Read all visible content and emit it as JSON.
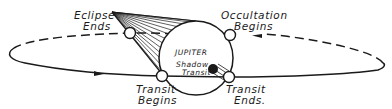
{
  "diagram": {
    "planet": {
      "label": "JUPITER",
      "shadow_transit_label_line1": "Shadow",
      "shadow_transit_label_line2": "Transit"
    },
    "events": [
      {
        "id": "eclipse-ends",
        "line1": "Eclipse",
        "line2": "Ends"
      },
      {
        "id": "occultation-begins",
        "line1": "Occultation",
        "line2": "Begins"
      },
      {
        "id": "transit-begins",
        "line1": "Transit",
        "line2": "Begins"
      },
      {
        "id": "transit-ends",
        "line1": "Transit",
        "line2": "Ends."
      }
    ],
    "colors": {
      "ink": "#1a1a1a",
      "background": "#ffffff"
    }
  }
}
